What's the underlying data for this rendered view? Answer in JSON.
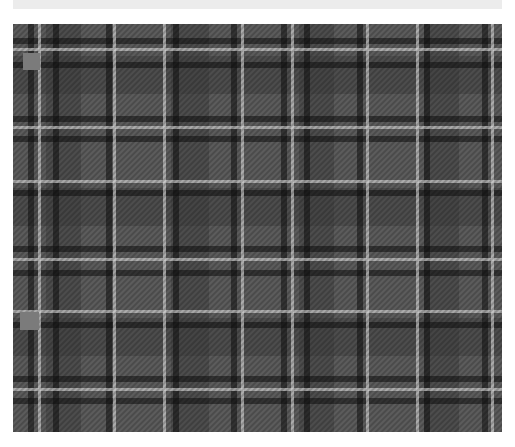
{
  "caption": {
    "text": ""
  },
  "plaid": {
    "colors": {
      "base": "#5c5c5c",
      "mid": "#3c3c3c",
      "dark": "#111111",
      "white": "#cfcfcf",
      "swatch": "#7b7b7b"
    },
    "vertical_white_lines_x": [
      25,
      100,
      150,
      228,
      278,
      353,
      403,
      478
    ],
    "vertical_black_bands_x": [
      15,
      40,
      93,
      160,
      218,
      268,
      291,
      344,
      411,
      469
    ],
    "horizontal_white_lines_y": [
      24,
      102,
      156,
      234,
      286,
      364
    ],
    "horizontal_black_bands_y": [
      14,
      38,
      92,
      112,
      166,
      222,
      246,
      298,
      352,
      374
    ],
    "swatches": [
      {
        "x": 10,
        "y": 29,
        "w": 17,
        "h": 17
      },
      {
        "x": 7,
        "y": 288,
        "w": 19,
        "h": 18
      }
    ]
  }
}
